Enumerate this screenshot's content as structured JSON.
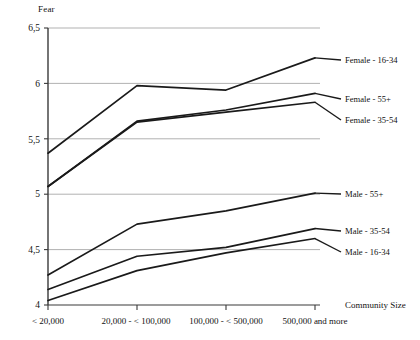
{
  "chart_data": {
    "type": "line",
    "title": "",
    "ylabel": "Fear",
    "xlabel": "Community Size",
    "categories": [
      "< 20,000",
      "20,000 - < 100,000",
      "100,000 - < 500,000",
      "500,000 and more"
    ],
    "ylim": [
      4,
      6.5
    ],
    "yticks": [
      "4",
      "4,5",
      "5",
      "5,5",
      "6",
      "6,5"
    ],
    "ytick_values": [
      4,
      4.5,
      5,
      5.5,
      6,
      6.5
    ],
    "grid": true,
    "legend_position": "right-inline",
    "series": [
      {
        "name": "Female - 16-34",
        "values": [
          5.37,
          5.98,
          5.94,
          6.23
        ]
      },
      {
        "name": "Female - 55+",
        "values": [
          5.07,
          5.66,
          5.76,
          5.91
        ]
      },
      {
        "name": "Female - 35-54",
        "values": [
          5.07,
          5.65,
          5.74,
          5.83
        ]
      },
      {
        "name": "Male - 55+",
        "values": [
          4.27,
          4.73,
          4.85,
          5.01
        ]
      },
      {
        "name": "Male - 35-54",
        "values": [
          4.14,
          4.44,
          4.52,
          4.69
        ]
      },
      {
        "name": "Male - 16-34",
        "values": [
          4.04,
          4.31,
          4.47,
          4.6
        ]
      }
    ],
    "line_color": "#1a1a1a",
    "grid_color": "#a8a8a8",
    "axis_color": "#3a3a3a"
  }
}
